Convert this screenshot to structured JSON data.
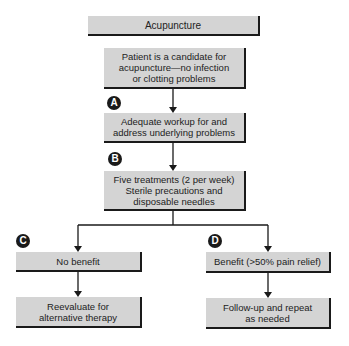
{
  "title": "Acupuncture",
  "nodes": {
    "root": "Acupuncture",
    "candidate": "Patient is a candidate for\nacupuncture—no infection\nor clotting problems",
    "workup": "Adequate workup for and\naddress underlying problems",
    "treatments": "Five treatments (2 per week)\nSterile precautions and\ndisposable needles",
    "no_benefit": "No benefit",
    "reevaluate": "Reevaluate for\nalternative therapy",
    "benefit": "Benefit (>50% pain relief)",
    "follow_up": "Follow-up and repeat\nas needed"
  },
  "badges": {
    "a": "A",
    "b": "B",
    "c": "C",
    "d": "D"
  },
  "colors": {
    "box_fill": "#d4d4d4",
    "shadow": "#1a1a1a",
    "line": "#1a1a1a"
  }
}
